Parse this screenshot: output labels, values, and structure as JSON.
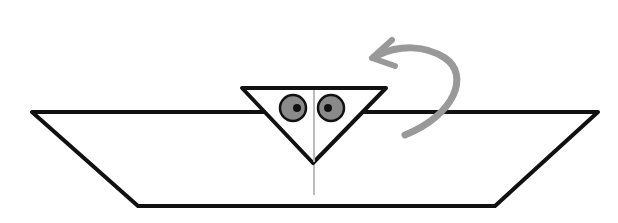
{
  "diagram": {
    "type": "origami-fold-step",
    "colors": {
      "outline": "#111111",
      "fold_line": "#bbbbbb",
      "arrow": "#999999",
      "eye_fill": "#8a8a8a",
      "pupil": "#111111",
      "background": "#ffffff"
    },
    "paper": {
      "shape": "trapezoid",
      "points": [
        [
          32,
          112
        ],
        [
          598,
          112
        ],
        [
          495,
          206
        ],
        [
          138,
          206
        ]
      ]
    },
    "flap": {
      "shape": "inverted-triangle",
      "points": [
        [
          242,
          88
        ],
        [
          386,
          88
        ],
        [
          313,
          163
        ]
      ]
    },
    "eyes": [
      {
        "cx": 293,
        "cy": 108,
        "r": 13,
        "pupil_cx": 297,
        "pupil_cy": 108
      },
      {
        "cx": 331,
        "cy": 108,
        "r": 13,
        "pupil_cx": 328,
        "pupil_cy": 108
      }
    ],
    "center_fold": {
      "x": 314,
      "y1": 90,
      "y2": 195
    },
    "arrow": {
      "meaning": "fold-behind",
      "direction": "counterclockwise"
    }
  }
}
